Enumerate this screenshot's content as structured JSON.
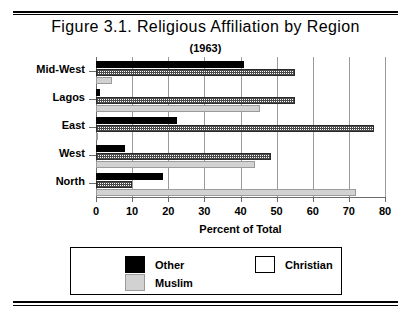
{
  "figure": {
    "title": "Figure 3.1. Religious Affiliation by Region",
    "subtitle": "(1963)"
  },
  "chart_data": {
    "type": "bar",
    "orientation": "horizontal",
    "title": "Figure 3.1. Religious Affiliation by Region",
    "subtitle": "(1963)",
    "xlabel": "Percent of Total",
    "ylabel": "",
    "xlim": [
      0,
      80
    ],
    "xticks": [
      0,
      10,
      20,
      30,
      40,
      50,
      60,
      70,
      80
    ],
    "grid": true,
    "legend_position": "bottom",
    "categories": [
      "Mid-West",
      "Lagos",
      "East",
      "West",
      "North"
    ],
    "series": [
      {
        "name": "Other",
        "color": "#000000",
        "values": [
          41,
          1,
          22.5,
          8,
          18.5
        ]
      },
      {
        "name": "Christian",
        "color": "#ffffff",
        "values": [
          55,
          55,
          77,
          48.5,
          10
        ]
      },
      {
        "name": "Muslim",
        "color": "#d2d2d2",
        "values": [
          4.5,
          45.5,
          0.5,
          44,
          72
        ]
      }
    ]
  },
  "legend": {
    "entries": [
      {
        "label": "Other"
      },
      {
        "label": "Christian"
      },
      {
        "label": "Muslim"
      }
    ]
  }
}
